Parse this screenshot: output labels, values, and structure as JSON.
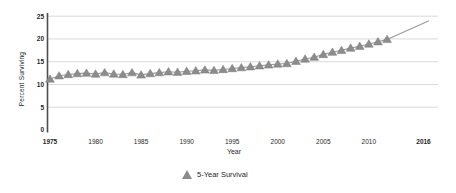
{
  "figure": {
    "y_axis_label": "Percent Surviving",
    "x_axis_label": "Year",
    "legend_label": "5-Year Survival"
  },
  "colors": {
    "background": "#ffffff",
    "marker": "#8c8c8c",
    "marker_edge": "#7a7a7a",
    "trend_line": "#9a9a9a",
    "grid_line": "#d9d9d9",
    "axis_line": "#4d4d4d",
    "text": "#1f1f1f"
  },
  "chart_data": {
    "type": "scatter",
    "title": "",
    "xlabel": "Year",
    "ylabel": "Percent Surviving",
    "marker": "triangle",
    "grid": "horizontal-only",
    "legend_position": "bottom-center",
    "legend_entries": [
      "5-Year Survival"
    ],
    "xlim": [
      1973.5,
      2017.5
    ],
    "ylim": [
      0,
      25
    ],
    "y_ticks": [
      0,
      5,
      10,
      15,
      20,
      25
    ],
    "x_ticks": [
      {
        "value": 1975,
        "bold": true
      },
      {
        "value": 1980,
        "bold": false
      },
      {
        "value": 1985,
        "bold": false
      },
      {
        "value": 1990,
        "bold": false
      },
      {
        "value": 1995,
        "bold": false
      },
      {
        "value": 2000,
        "bold": false
      },
      {
        "value": 2005,
        "bold": false
      },
      {
        "value": 2010,
        "bold": false
      },
      {
        "value": 2016,
        "bold": true
      }
    ],
    "series": [
      {
        "name": "5-Year Survival",
        "x": [
          1975,
          1976,
          1977,
          1978,
          1979,
          1980,
          1981,
          1982,
          1983,
          1984,
          1985,
          1986,
          1987,
          1988,
          1989,
          1990,
          1991,
          1992,
          1993,
          1994,
          1995,
          1996,
          1997,
          1998,
          1999,
          2000,
          2001,
          2002,
          2003,
          2004,
          2005,
          2006,
          2007,
          2008,
          2009,
          2010,
          2011,
          2012
        ],
        "y": [
          11.2,
          11.9,
          12.2,
          12.4,
          12.5,
          12.3,
          12.6,
          12.3,
          12.2,
          12.6,
          12.1,
          12.4,
          12.6,
          12.8,
          12.7,
          12.9,
          13.0,
          13.2,
          13.1,
          13.3,
          13.5,
          13.7,
          13.9,
          14.1,
          14.3,
          14.5,
          14.6,
          15.1,
          15.6,
          16.0,
          16.6,
          17.1,
          17.5,
          18.0,
          18.4,
          18.9,
          19.4,
          19.9
        ]
      }
    ],
    "trend_line": {
      "through_data": true,
      "extends_to": {
        "x": 2016.6,
        "y": 24.0
      }
    }
  }
}
